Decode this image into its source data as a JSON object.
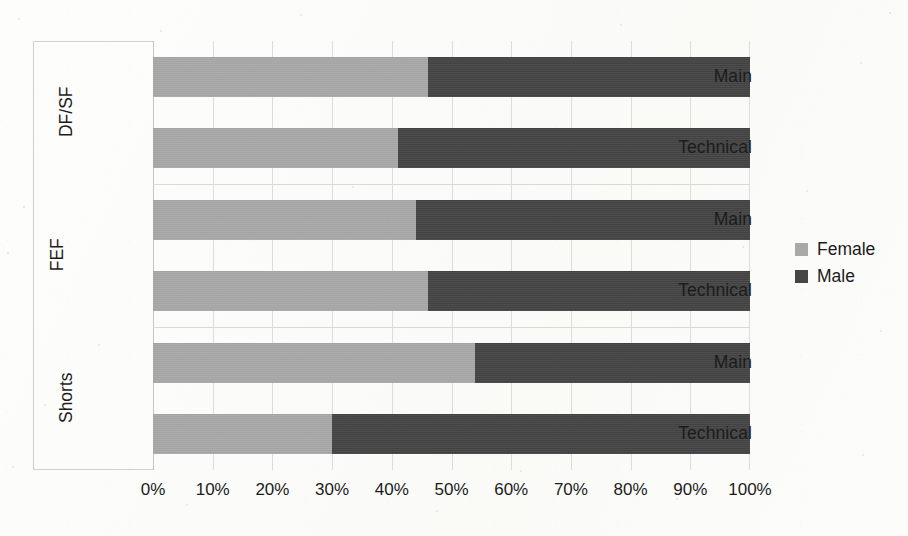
{
  "chart_data": {
    "type": "bar",
    "orientation": "horizontal",
    "stacked": true,
    "normalized_percent": true,
    "title": "",
    "subtitle": "",
    "xlabel": "",
    "ylabel": "",
    "xlim": [
      0,
      100
    ],
    "grid": true,
    "legend_position": "right",
    "x_tick_labels": [
      "0%",
      "10%",
      "20%",
      "30%",
      "40%",
      "50%",
      "60%",
      "70%",
      "80%",
      "90%",
      "100%"
    ],
    "x_tick_values": [
      0,
      10,
      20,
      30,
      40,
      50,
      60,
      70,
      80,
      90,
      100
    ],
    "groups": [
      {
        "name": "DF/SF",
        "categories": [
          "Main",
          "Technical"
        ]
      },
      {
        "name": "FEF",
        "categories": [
          "Main",
          "Technical"
        ]
      },
      {
        "name": "Shorts",
        "categories": [
          "Main",
          "Technical"
        ]
      }
    ],
    "categories": [
      "DF/SF - Main",
      "DF/SF - Technical",
      "FEF - Main",
      "FEF - Technical",
      "Shorts - Main",
      "Shorts - Technical"
    ],
    "series": [
      {
        "name": "Female",
        "color": "#a9a9a9",
        "values": [
          46,
          41,
          44,
          46,
          54,
          30
        ]
      },
      {
        "name": "Male",
        "color": "#464646",
        "values": [
          54,
          59,
          56,
          54,
          46,
          70
        ]
      }
    ]
  },
  "legend": {
    "items": [
      {
        "label": "Female",
        "color": "#a9a9a9"
      },
      {
        "label": "Male",
        "color": "#464646"
      }
    ]
  },
  "axis": {
    "x_ticks": [
      "0%",
      "10%",
      "20%",
      "30%",
      "40%",
      "50%",
      "60%",
      "70%",
      "80%",
      "90%",
      "100%"
    ]
  },
  "bars": [
    {
      "group": "DF/SF",
      "label": "Main",
      "female": 46,
      "male": 54
    },
    {
      "group": "DF/SF",
      "label": "Technical",
      "female": 41,
      "male": 59
    },
    {
      "group": "FEF",
      "label": "Main",
      "female": 44,
      "male": 56
    },
    {
      "group": "FEF",
      "label": "Technical",
      "female": 46,
      "male": 54
    },
    {
      "group": "Shorts",
      "label": "Main",
      "female": 54,
      "male": 46
    },
    {
      "group": "Shorts",
      "label": "Technical",
      "female": 30,
      "male": 70
    }
  ],
  "group_labels": [
    {
      "name": "DF/SF"
    },
    {
      "name": "FEF"
    },
    {
      "name": "Shorts"
    }
  ]
}
